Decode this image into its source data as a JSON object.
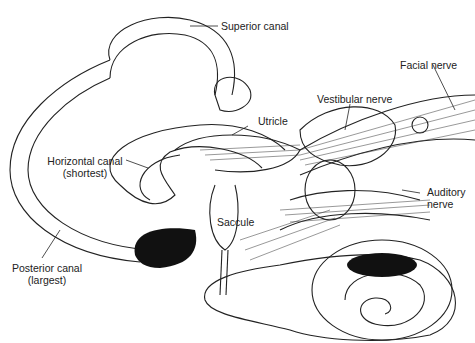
{
  "diagram": {
    "labels": {
      "superior_canal": "Superior canal",
      "facial_nerve": "Facial nerve",
      "vestibular_nerve": "Vestibular nerve",
      "utricle": "Utricle",
      "horizontal_canal_1": "Horizontal canal",
      "horizontal_canal_2": "(shortest)",
      "saccule": "Saccule",
      "auditory_nerve_1": "Auditory",
      "auditory_nerve_2": "nerve",
      "posterior_canal_1": "Posterior canal",
      "posterior_canal_2": "(largest)"
    }
  }
}
